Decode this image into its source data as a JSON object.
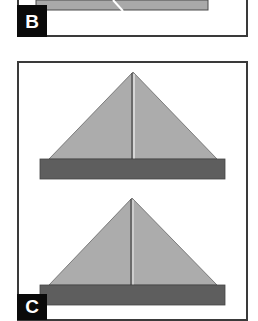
{
  "figure": {
    "panels": [
      {
        "id": "B",
        "label": "B",
        "description": "partial view of folded sheet with white diagonal crease"
      },
      {
        "id": "C",
        "label": "C",
        "description": "two stacked triangular folds over dark base strips"
      }
    ],
    "colors": {
      "light_gray": "#a9a9a9",
      "dark_gray": "#5e5e5e",
      "border": "#3a3a3a",
      "label_bg": "#0a0a0a",
      "label_text": "#ffffff"
    }
  }
}
